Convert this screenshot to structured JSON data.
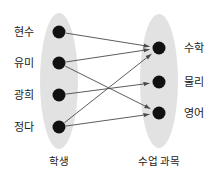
{
  "diagram": {
    "type": "bipartite-mapping",
    "colors": {
      "ellipse_fill": "#e2e2e2",
      "node_fill": "#111111",
      "edge": "#4a4a4a",
      "text": "#1a1a1a",
      "background": "#ffffff"
    },
    "domain_set": {
      "caption": "학생",
      "caption_x": 59,
      "caption_y": 156,
      "ellipse": {
        "cx": 59,
        "cy": 81,
        "rx": 19,
        "ry": 68
      },
      "nodes": [
        {
          "id": "hyunsu",
          "label": "현수",
          "x": 59,
          "y": 32,
          "label_x": 34,
          "label_y": 32
        },
        {
          "id": "yumi",
          "label": "유미",
          "x": 59,
          "y": 63,
          "label_x": 34,
          "label_y": 63
        },
        {
          "id": "gwanghee",
          "label": "광희",
          "x": 59,
          "y": 95,
          "label_x": 34,
          "label_y": 95
        },
        {
          "id": "jeongda",
          "label": "정다",
          "x": 59,
          "y": 127,
          "label_x": 34,
          "label_y": 127
        }
      ]
    },
    "codomain_set": {
      "caption": "수업 과목",
      "caption_x": 159,
      "caption_y": 156,
      "ellipse": {
        "cx": 159,
        "cy": 81,
        "rx": 19,
        "ry": 67
      },
      "nodes": [
        {
          "id": "math",
          "label": "수학",
          "x": 159,
          "y": 48,
          "label_x": 184,
          "label_y": 48
        },
        {
          "id": "physics",
          "label": "물리",
          "x": 159,
          "y": 82,
          "label_x": 184,
          "label_y": 82
        },
        {
          "id": "english",
          "label": "영어",
          "x": 159,
          "y": 113,
          "label_x": 184,
          "label_y": 113
        }
      ]
    },
    "edges": [
      {
        "from": "hyunsu",
        "to": "math"
      },
      {
        "from": "yumi",
        "to": "math"
      },
      {
        "from": "yumi",
        "to": "english"
      },
      {
        "from": "gwanghee",
        "to": "physics"
      },
      {
        "from": "jeongda",
        "to": "math"
      },
      {
        "from": "jeongda",
        "to": "english"
      }
    ],
    "node_radius": 6.5,
    "edge_width": 0.9,
    "arrowhead": true
  }
}
